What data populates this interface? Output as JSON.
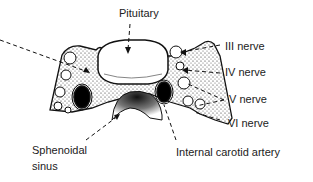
{
  "diagram": {
    "type": "anatomical cross-section",
    "labels": {
      "pituitary": "Pituitary",
      "nerve3": "III nerve",
      "nerve4": "IV nerve",
      "nerve5": "V nerve",
      "nerve6": "VI nerve",
      "sphenoidal_line1": "Sphenoidal",
      "sphenoidal_line2": "sinus",
      "carotid": "Internal carotid artery"
    },
    "colors": {
      "ink": "#111111",
      "paper": "#ffffff"
    }
  }
}
